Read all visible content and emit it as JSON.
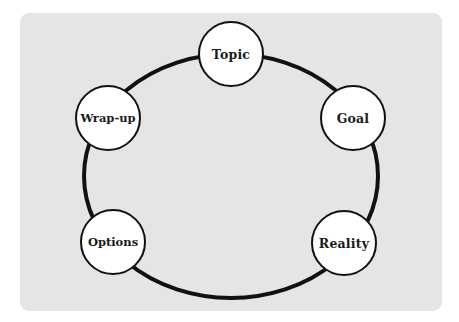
{
  "diagram": {
    "type": "cycle",
    "background_color": "#e5e5e5",
    "ring_color": "#111111",
    "node_fill": "#ffffff",
    "nodes": [
      {
        "id": "topic",
        "label": "Topic",
        "x": 231,
        "y": 54
      },
      {
        "id": "goal",
        "label": "Goal",
        "x": 353,
        "y": 118
      },
      {
        "id": "reality",
        "label": "Reality",
        "x": 344,
        "y": 243
      },
      {
        "id": "options",
        "label": "Options",
        "x": 113,
        "y": 242
      },
      {
        "id": "wrap-up",
        "label": "Wrap-up",
        "x": 108,
        "y": 118
      }
    ],
    "order": [
      "Topic",
      "Goal",
      "Reality",
      "Options",
      "Wrap-up"
    ]
  }
}
